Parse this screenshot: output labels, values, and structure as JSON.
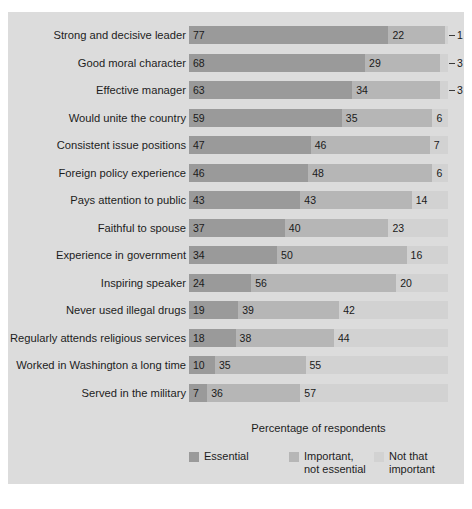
{
  "chart_data": {
    "type": "bar",
    "subtype": "stacked-horizontal-100",
    "title": "",
    "xlabel": "Percentage of respondents",
    "ylabel": "",
    "xlim": [
      0,
      100
    ],
    "grid": false,
    "legend_position": "bottom",
    "categories": [
      "Strong and decisive leader",
      "Good moral character",
      "Effective manager",
      "Would unite the country",
      "Consistent issue positions",
      "Foreign policy experience",
      "Pays attention to public",
      "Faithful to spouse",
      "Experience in government",
      "Inspiring speaker",
      "Never used illegal drugs",
      "Regularly attends religious services",
      "Worked in Washington a long time",
      "Served in the military"
    ],
    "series": [
      {
        "name": "Essential",
        "color": "#9a9a9a",
        "values": [
          77,
          68,
          63,
          59,
          47,
          46,
          43,
          37,
          34,
          24,
          19,
          18,
          10,
          7
        ]
      },
      {
        "name": "Important, not essential",
        "color": "#b6b6b6",
        "values": [
          22,
          29,
          34,
          35,
          46,
          48,
          43,
          40,
          50,
          56,
          39,
          38,
          35,
          36
        ]
      },
      {
        "name": "Not that important",
        "color": "#d2d2d2",
        "values": [
          1,
          3,
          3,
          6,
          7,
          6,
          14,
          23,
          16,
          20,
          42,
          44,
          55,
          57
        ]
      }
    ],
    "rows": [
      {
        "label": "Strong and decisive leader",
        "essential": 77,
        "important": 22,
        "not_important": 1,
        "not_important_outside": true
      },
      {
        "label": "Good moral character",
        "essential": 68,
        "important": 29,
        "not_important": 3,
        "not_important_outside": true
      },
      {
        "label": "Effective manager",
        "essential": 63,
        "important": 34,
        "not_important": 3,
        "not_important_outside": true
      },
      {
        "label": "Would unite the country",
        "essential": 59,
        "important": 35,
        "not_important": 6,
        "not_important_outside": false
      },
      {
        "label": "Consistent issue positions",
        "essential": 47,
        "important": 46,
        "not_important": 7,
        "not_important_outside": false
      },
      {
        "label": "Foreign policy experience",
        "essential": 46,
        "important": 48,
        "not_important": 6,
        "not_important_outside": false
      },
      {
        "label": "Pays attention to public",
        "essential": 43,
        "important": 43,
        "not_important": 14,
        "not_important_outside": false
      },
      {
        "label": "Faithful to spouse",
        "essential": 37,
        "important": 40,
        "not_important": 23,
        "not_important_outside": false
      },
      {
        "label": "Experience in government",
        "essential": 34,
        "important": 50,
        "not_important": 16,
        "not_important_outside": false
      },
      {
        "label": "Inspiring speaker",
        "essential": 24,
        "important": 56,
        "not_important": 20,
        "not_important_outside": false
      },
      {
        "label": "Never used illegal drugs",
        "essential": 19,
        "important": 39,
        "not_important": 42,
        "not_important_outside": false
      },
      {
        "label": "Regularly attends religious services",
        "essential": 18,
        "important": 38,
        "not_important": 44,
        "not_important_outside": false
      },
      {
        "label": "Worked in Washington a long time",
        "essential": 10,
        "important": 35,
        "not_important": 55,
        "not_important_outside": false
      },
      {
        "label": "Served in the military",
        "essential": 7,
        "important": 36,
        "not_important": 57,
        "not_important_outside": false
      }
    ],
    "legend": [
      {
        "label": "Essential",
        "color": "#9a9a9a"
      },
      {
        "label": "Important,\nnot essential",
        "color": "#b6b6b6"
      },
      {
        "label": "Not that\nimportant",
        "color": "#d2d2d2"
      }
    ]
  },
  "colors": {
    "panel_background": "#dcdcdc",
    "page_background": "#ffffff",
    "bar_track": "#c9c9c9",
    "text": "#1c1c1c"
  }
}
